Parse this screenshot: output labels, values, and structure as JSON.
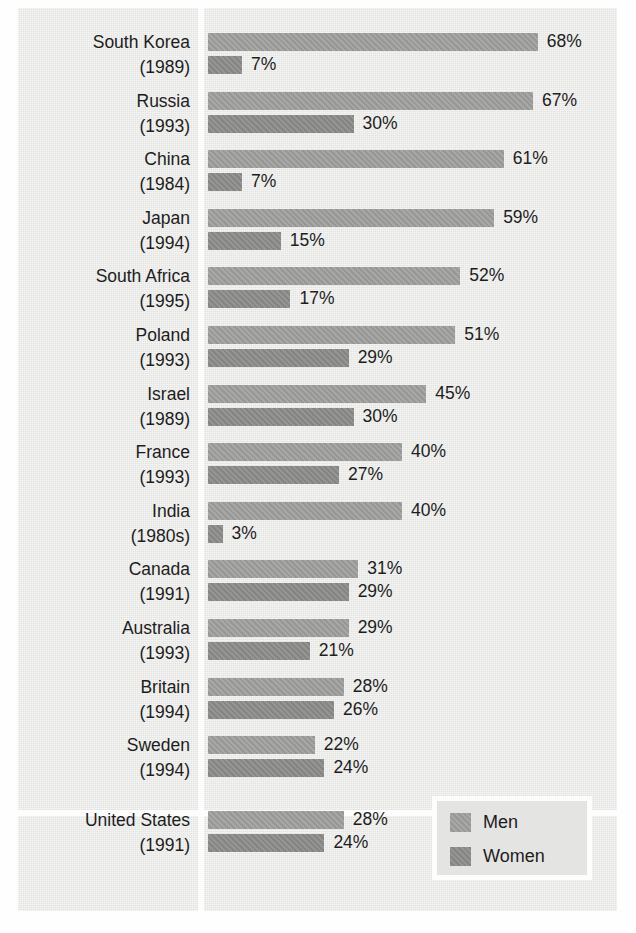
{
  "chart_data": {
    "type": "bar",
    "orientation": "horizontal",
    "title": "",
    "xlabel": "",
    "ylabel": "",
    "grid": false,
    "xlim": [
      0,
      68
    ],
    "value_suffix": "%",
    "legend_position": "bottom-right",
    "series": [
      {
        "name": "Men",
        "color": "#9d9d9b",
        "values": [
          68,
          67,
          61,
          59,
          52,
          51,
          45,
          40,
          40,
          31,
          29,
          28,
          22,
          28
        ]
      },
      {
        "name": "Women",
        "color": "#8a8a88",
        "values": [
          7,
          30,
          7,
          15,
          17,
          29,
          30,
          27,
          3,
          29,
          21,
          26,
          24,
          24
        ]
      }
    ],
    "categories": [
      "South Korea (1989)",
      "Russia (1993)",
      "China (1984)",
      "Japan (1994)",
      "South Africa (1995)",
      "Poland (1993)",
      "Israel (1989)",
      "France (1993)",
      "India (1980s)",
      "Canada (1991)",
      "Australia (1993)",
      "Britain (1994)",
      "Sweden (1994)",
      "United States (1991)"
    ]
  },
  "rows": [
    {
      "country": "South Korea",
      "year": "(1989)",
      "men": 68,
      "women": 7,
      "men_label": "68%",
      "women_label": "7%"
    },
    {
      "country": "Russia",
      "year": "(1993)",
      "men": 67,
      "women": 30,
      "men_label": "67%",
      "women_label": "30%"
    },
    {
      "country": "China",
      "year": "(1984)",
      "men": 61,
      "women": 7,
      "men_label": "61%",
      "women_label": "7%"
    },
    {
      "country": "Japan",
      "year": "(1994)",
      "men": 59,
      "women": 15,
      "men_label": "59%",
      "women_label": "15%"
    },
    {
      "country": "South Africa",
      "year": "(1995)",
      "men": 52,
      "women": 17,
      "men_label": "52%",
      "women_label": "17%"
    },
    {
      "country": "Poland",
      "year": "(1993)",
      "men": 51,
      "women": 29,
      "men_label": "51%",
      "women_label": "29%"
    },
    {
      "country": "Israel",
      "year": "(1989)",
      "men": 45,
      "women": 30,
      "men_label": "45%",
      "women_label": "30%"
    },
    {
      "country": "France",
      "year": "(1993)",
      "men": 40,
      "women": 27,
      "men_label": "40%",
      "women_label": "27%"
    },
    {
      "country": "India",
      "year": "(1980s)",
      "men": 40,
      "women": 3,
      "men_label": "40%",
      "women_label": "3%"
    },
    {
      "country": "Canada",
      "year": "(1991)",
      "men": 31,
      "women": 29,
      "men_label": "31%",
      "women_label": "29%"
    },
    {
      "country": "Australia",
      "year": "(1993)",
      "men": 29,
      "women": 21,
      "men_label": "29%",
      "women_label": "21%"
    },
    {
      "country": "Britain",
      "year": "(1994)",
      "men": 28,
      "women": 26,
      "men_label": "28%",
      "women_label": "26%"
    },
    {
      "country": "Sweden",
      "year": "(1994)",
      "men": 22,
      "women": 24,
      "men_label": "22%",
      "women_label": "24%"
    },
    {
      "country": "United States",
      "year": "(1991)",
      "men": 28,
      "women": 24,
      "men_label": "28%",
      "women_label": "24%"
    }
  ],
  "legend": {
    "men_label": "Men",
    "women_label": "Women"
  },
  "colors": {
    "men_bar": "#9d9d9b",
    "women_bar": "#8a8a88",
    "panel_background": "#e9e9e7",
    "divider": "#fdfdfd",
    "text": "#1d1d1d"
  }
}
